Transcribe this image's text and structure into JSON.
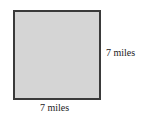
{
  "diagram": {
    "shape": "square",
    "fill_color": "#d5d5d5",
    "border_color": "#3a3a3a",
    "side_label": "7 miles",
    "bottom_label": "7 miles"
  }
}
